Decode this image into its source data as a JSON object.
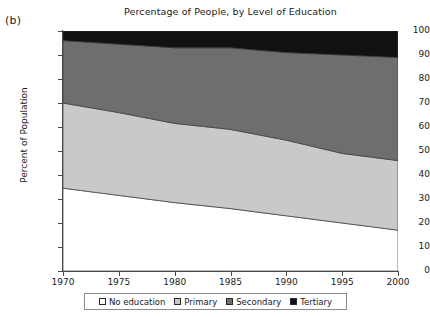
{
  "panel_label": "(b)",
  "chart_data": {
    "type": "area",
    "stacked": true,
    "title": "Percentage of People, by Level of Education",
    "xlabel": "",
    "ylabel": "Percent of Population",
    "xlim": [
      1970,
      2000
    ],
    "ylim": [
      0,
      100
    ],
    "grid": false,
    "legend_position": "bottom",
    "x": [
      1970,
      1975,
      1980,
      1985,
      1990,
      1995,
      2000
    ],
    "xticks": [
      1970,
      1975,
      1980,
      1985,
      1990,
      1995,
      2000
    ],
    "yticks": [
      0,
      10,
      20,
      30,
      40,
      50,
      60,
      70,
      80,
      90,
      100
    ],
    "series": [
      {
        "name": "No education",
        "color": "#ffffff",
        "values": [
          34.5,
          31.5,
          28.5,
          26.0,
          23.0,
          20.0,
          17.0
        ]
      },
      {
        "name": "Primary",
        "color": "#c9c9c9",
        "values": [
          35.5,
          34.5,
          33.0,
          33.0,
          31.5,
          29.0,
          29.0
        ]
      },
      {
        "name": "Secondary",
        "color": "#6e6e6e",
        "values": [
          26.0,
          28.5,
          31.5,
          34.0,
          36.5,
          41.0,
          43.0
        ]
      },
      {
        "name": "Tertiary",
        "color": "#111111",
        "values": [
          4.0,
          5.5,
          7.0,
          7.0,
          9.0,
          10.0,
          11.0
        ]
      }
    ],
    "cumulative_upper_bounds": {
      "no_education": [
        34.5,
        31.5,
        28.5,
        26.0,
        23.0,
        20.0,
        17.0
      ],
      "primary": [
        70.0,
        66.0,
        61.5,
        59.0,
        54.5,
        49.0,
        46.0
      ],
      "secondary": [
        96.0,
        94.5,
        93.0,
        93.0,
        91.0,
        90.0,
        89.0
      ],
      "tertiary": [
        100,
        100,
        100,
        100,
        100,
        100,
        100
      ]
    }
  },
  "legend": {
    "items": [
      {
        "label": "No education",
        "color": "#ffffff"
      },
      {
        "label": "Primary",
        "color": "#c9c9c9"
      },
      {
        "label": "Secondary",
        "color": "#6e6e6e"
      },
      {
        "label": "Tertiary",
        "color": "#111111"
      }
    ]
  }
}
